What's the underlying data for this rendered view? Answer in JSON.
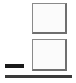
{
  "canvas": {
    "width": 76,
    "height": 83,
    "background_color": "#ffffff"
  },
  "panels": [
    {
      "name": "upper-panel",
      "label": "",
      "x": 32,
      "y": 3,
      "width": 35,
      "height": 31,
      "fill_color": "#fbfbfb",
      "border_color": "#8a8a8a",
      "shadow_color": "#6f6f6f"
    },
    {
      "name": "lower-panel",
      "label": "",
      "x": 32,
      "y": 39,
      "width": 35,
      "height": 32,
      "fill_color": "#fbfbfb",
      "border_color": "#8a8a8a",
      "shadow_color": "#6f6f6f"
    }
  ],
  "dash_bar": {
    "label": "",
    "x": 5,
    "y": 64,
    "width": 19,
    "height": 4,
    "color": "#1a1a1a"
  },
  "bottom_divider": {
    "label": "",
    "x": 5,
    "y": 75,
    "width": 67,
    "height": 3,
    "color": "#3a3a3a"
  }
}
